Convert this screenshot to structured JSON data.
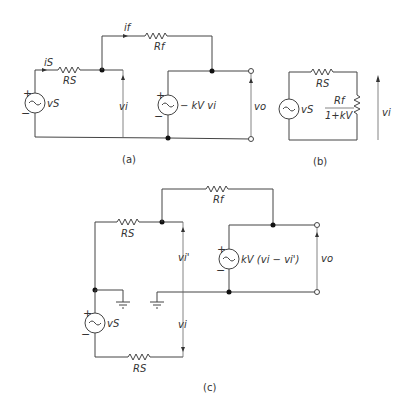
{
  "figure": {
    "a": {
      "caption": "(a)",
      "labels": {
        "i_s": "iS",
        "i_f": "if",
        "R_s": "RS",
        "R_f": "Rf",
        "v_s": "vS",
        "v_i": "vi",
        "v_o": "vo",
        "dep_source": "− kV vi",
        "plus": "+",
        "minus": "−"
      }
    },
    "b": {
      "caption": "(b)",
      "labels": {
        "R_s": "RS",
        "v_s": "vS",
        "R_f_num": "Rf",
        "R_f_den": "1+kV",
        "v_i": "vi"
      }
    },
    "c": {
      "caption": "(c)",
      "labels": {
        "R_s_top": "RS",
        "R_s_bottom": "RS",
        "R_f": "Rf",
        "v_s": "vS",
        "v_i_prime": "vi'",
        "v_i": "vi",
        "v_o": "vo",
        "dep_source": "kV (vi − vi')",
        "plus": "+",
        "minus": "−"
      }
    }
  }
}
